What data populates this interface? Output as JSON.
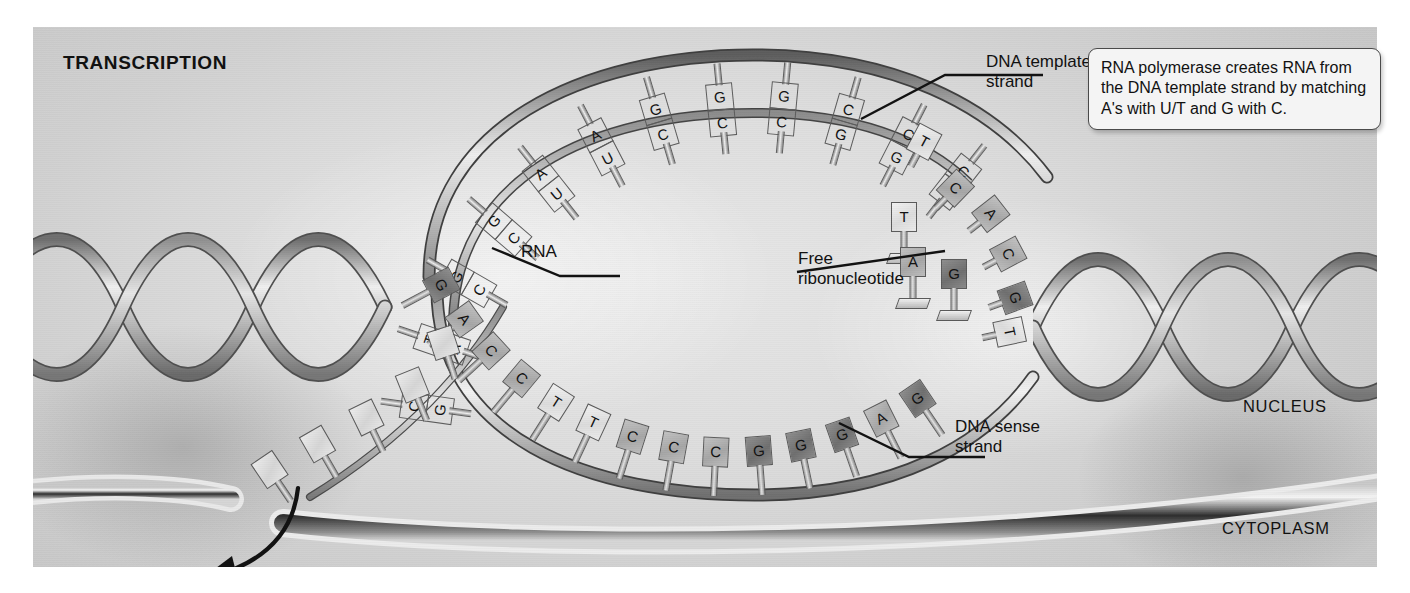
{
  "figure": {
    "title": "TRANSCRIPTION",
    "domain": "molecular-biology-diagram"
  },
  "callout": {
    "text": "RNA polymerase creates RNA from the DNA template strand by matching A's with U/T and G with C."
  },
  "labels": {
    "dna_template_strand": "DNA template\nstrand",
    "rna": "RNA",
    "free_ribonucleotide": "Free\nribonucleotide",
    "dna_sense_strand": "DNA sense\nstrand",
    "nucleus": "NUCLEUS",
    "cytoplasm": "CYTOPLASM"
  },
  "colors": {
    "ink": "#111111",
    "outline": "#5a5a5a",
    "purine_dark": "#7c7c7c",
    "pyrimidine_mid": "#b4b4b4",
    "light_base": "#ececec",
    "callout_fill": "#f4f4f4",
    "background": "#dedede"
  },
  "template_strand": {
    "name": "DNA template strand",
    "paired_bases": [
      "C",
      "T",
      "G",
      "G",
      "A",
      "A",
      "G",
      "G",
      "G",
      "C",
      "C",
      "C"
    ],
    "unpaired_bases": [
      "T",
      "C",
      "A",
      "C",
      "G",
      "T"
    ]
  },
  "rna_strand": {
    "name": "RNA",
    "paired_bases": [
      "G",
      "A",
      "C",
      "C",
      "U",
      "U",
      "C",
      "C",
      "C",
      "G",
      "G",
      "G"
    ],
    "exiting_bases": [
      "",
      "",
      "",
      "",
      ""
    ]
  },
  "sense_strand": {
    "name": "DNA sense strand",
    "bases": [
      "G",
      "A",
      "C",
      "C",
      "T",
      "T",
      "C",
      "C",
      "C",
      "G",
      "G",
      "G",
      "A",
      "G"
    ]
  },
  "free_ribonucleotides": [
    {
      "base": "T",
      "on_stand": true
    },
    {
      "base": "A",
      "on_stand": true
    },
    {
      "base": "G",
      "on_stand": true
    }
  ],
  "base_shapes": {
    "G": "rounded-dome",
    "A": "notched-double",
    "T": "pentagon-house",
    "C": "crescent-notch",
    "U": "v-notch",
    "blank": "square"
  }
}
